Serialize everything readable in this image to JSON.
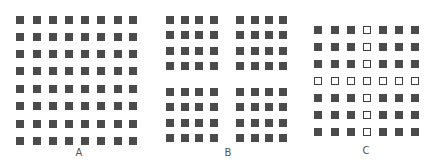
{
  "figure": {
    "colors": {
      "filled_square": "#4b4b4b",
      "hollow_border": "#3f3f3f",
      "background": "#ffffff",
      "label": "#555555"
    },
    "panels": [
      {
        "id": "A",
        "label": "A",
        "rows": 8,
        "cols": 8,
        "col_x": [
          16,
          33,
          49,
          65,
          81,
          97,
          114,
          129
        ],
        "row_y": [
          16,
          33,
          50,
          67,
          85,
          102,
          120,
          137
        ],
        "hollow_row": null,
        "hollow_col": null,
        "label_x": 79,
        "label_y": 148
      },
      {
        "id": "B",
        "label": "B",
        "rows": 8,
        "cols": 8,
        "col_x": [
          166,
          181,
          195,
          210,
          236,
          251,
          265,
          279
        ],
        "row_y": [
          16,
          31,
          47,
          62,
          88,
          103,
          119,
          134
        ],
        "hollow_row": null,
        "hollow_col": null,
        "label_x": 228,
        "label_y": 148
      },
      {
        "id": "C",
        "label": "C",
        "rows": 7,
        "cols": 7,
        "col_x": [
          314,
          331,
          347,
          363,
          379,
          395,
          411
        ],
        "row_y": [
          26,
          43,
          60,
          77,
          94,
          111,
          128
        ],
        "hollow_row": 3,
        "hollow_col": 3,
        "label_x": 366,
        "label_y": 146
      }
    ]
  }
}
